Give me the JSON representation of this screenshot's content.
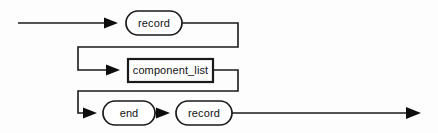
{
  "diagram": {
    "type": "railroad-syntax-diagram",
    "background_color": "#fdfdfd",
    "line_color": "#1a1a1a",
    "text_color": "#111111",
    "entry": {
      "name": "entry-rail",
      "x_start": 18,
      "x_end": 126,
      "y": 23
    },
    "exit": {
      "name": "exit-rail",
      "x_start": 235,
      "x_end": 420,
      "y": 113
    },
    "rows": [
      {
        "index": 0,
        "y": 23,
        "nodes": [
          {
            "id": "record-keyword-top",
            "shape": "oval",
            "label": "record",
            "x": 126,
            "y": 11,
            "width": 56,
            "height": 24
          }
        ],
        "arrows": [
          {
            "id": "arrow-to-record-top",
            "x": 112,
            "y": 23
          }
        ]
      },
      {
        "index": 1,
        "y": 70,
        "nodes": [
          {
            "id": "component-list",
            "shape": "rect",
            "label": "component_list",
            "x": 128,
            "y": 59,
            "width": 85,
            "height": 23
          }
        ],
        "arrows": [
          {
            "id": "arrow-to-component-list",
            "x": 114,
            "y": 70
          }
        ]
      },
      {
        "index": 2,
        "y": 113,
        "nodes": [
          {
            "id": "end-keyword",
            "shape": "oval",
            "label": "end",
            "x": 103,
            "y": 101,
            "width": 52,
            "height": 24
          },
          {
            "id": "record-keyword-bottom",
            "shape": "oval",
            "label": "record",
            "x": 176,
            "y": 101,
            "width": 56,
            "height": 24
          }
        ],
        "arrows": [
          {
            "id": "arrow-to-end",
            "x": 89,
            "y": 113
          },
          {
            "id": "arrow-to-record-bottom",
            "x": 162,
            "y": 113
          },
          {
            "id": "arrow-exit",
            "x": 412,
            "y": 113
          }
        ]
      }
    ],
    "connectors": [
      {
        "id": "connector-row0-to-row1",
        "description": "from right of record (top) down and left into component_list row",
        "path": "M 182 23 L 238 23 L 238 47 L 78 47 L 78 70 L 112 70"
      },
      {
        "id": "connector-row1-to-row2",
        "description": "from right of component_list down and left into end row",
        "path": "M 213 70 L 238 70 L 238 91 L 78 91 L 78 113 L 87 113"
      }
    ],
    "labels": {
      "record_top": "record",
      "component_list": "component_list",
      "end": "end",
      "record_bottom": "record"
    }
  }
}
